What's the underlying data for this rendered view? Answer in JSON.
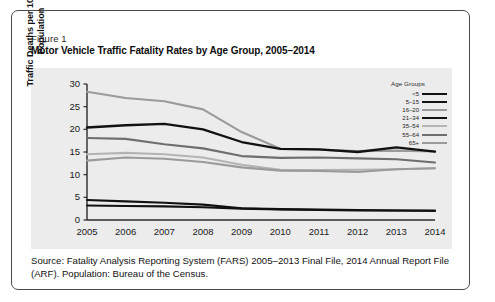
{
  "figure": {
    "label": "Figure 1",
    "title": "Motor Vehicle Traffic Fatality Rates by Age Group, 2005–2014",
    "source": "Source: Fatality Analysis Reporting System (FARS) 2005–2013 Final File, 2014 Annual Report File (ARF). Population: Bureau of the Census."
  },
  "legend": {
    "title": "Age Groups"
  },
  "chart_data": {
    "type": "line",
    "title": "Motor Vehicle Traffic Fatality Rates by Age Group, 2005–2014",
    "xlabel": "",
    "ylabel": "Traffic Deaths per 100,000 Population",
    "x": [
      2005,
      2006,
      2007,
      2008,
      2009,
      2010,
      2011,
      2012,
      2013,
      2014
    ],
    "xticklabels": [
      "2005",
      "2006",
      "2007",
      "2008",
      "2009",
      "2010",
      "2011",
      "2012",
      "2013",
      "2014"
    ],
    "yticklabels": [
      "0",
      "5",
      "10",
      "15",
      "20",
      "25",
      "30"
    ],
    "yticks": [
      0,
      5,
      10,
      15,
      20,
      25,
      30
    ],
    "ylim": [
      0,
      30
    ],
    "xlim": [
      2005,
      2014
    ],
    "grid": false,
    "legend_position": "top-right",
    "legend_title": "Age Groups",
    "series": [
      {
        "name": "<5",
        "color": "#111111",
        "width": 2.1,
        "values": [
          4.4,
          4.1,
          3.8,
          3.4,
          2.6,
          2.4,
          2.3,
          2.2,
          2.1,
          2.1
        ]
      },
      {
        "name": "5–15",
        "color": "#111111",
        "width": 2.1,
        "values": [
          3.2,
          3.1,
          3.0,
          2.8,
          2.5,
          2.3,
          2.2,
          2.1,
          2.1,
          2.0
        ]
      },
      {
        "name": "16–20",
        "color": "#9a9a9a",
        "width": 2.1,
        "values": [
          28.3,
          26.9,
          26.2,
          24.4,
          19.4,
          15.7,
          15.5,
          15.2,
          15.3,
          15.1
        ]
      },
      {
        "name": "21–34",
        "color": "#111111",
        "width": 2.3,
        "values": [
          20.4,
          20.9,
          21.2,
          20.0,
          17.2,
          15.7,
          15.6,
          15.0,
          16.0,
          15.1
        ]
      },
      {
        "name": "35–54",
        "color": "#b4b4b4",
        "width": 2.1,
        "values": [
          14.5,
          14.8,
          14.5,
          13.8,
          12.2,
          11.1,
          11.0,
          11.1,
          11.2,
          11.4
        ]
      },
      {
        "name": "55–64",
        "color": "#6e6e6e",
        "width": 2.1,
        "values": [
          18.1,
          17.9,
          16.7,
          15.8,
          14.1,
          13.7,
          13.8,
          13.6,
          13.4,
          12.7
        ]
      },
      {
        "name": "65+",
        "color": "#9a9a9a",
        "width": 2.1,
        "values": [
          13.1,
          13.8,
          13.5,
          12.8,
          11.6,
          10.9,
          10.8,
          10.6,
          11.2,
          11.4
        ]
      }
    ]
  }
}
